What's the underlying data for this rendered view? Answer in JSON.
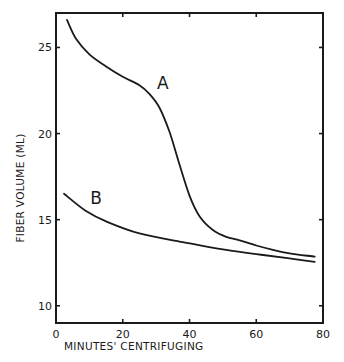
{
  "chart_data": {
    "type": "line",
    "title": "",
    "xlabel": "MINUTES' CENTRIFUGING",
    "ylabel": "FIBER VOLUME  (ML)",
    "xlim": [
      0,
      80
    ],
    "ylim": [
      9,
      27
    ],
    "xticks": [
      0,
      20,
      40,
      60,
      80
    ],
    "yticks": [
      10,
      15,
      20,
      25
    ],
    "xtick_labels": [
      "0",
      "20",
      "40",
      "60",
      "80"
    ],
    "ytick_labels": [
      "10",
      "15",
      "20",
      "25"
    ],
    "grid": false,
    "legend": "none",
    "series": [
      {
        "name": "A",
        "label_at": [
          32,
          22.6
        ],
        "x": [
          3.3,
          6,
          10,
          15,
          20,
          25,
          28,
          31,
          34,
          37,
          40,
          43,
          47,
          51,
          55,
          60,
          65,
          70,
          77.5
        ],
        "y": [
          26.6,
          25.5,
          24.6,
          23.9,
          23.3,
          22.8,
          22.3,
          21.5,
          20.1,
          18.2,
          16.4,
          15.2,
          14.4,
          14.0,
          13.8,
          13.5,
          13.25,
          13.05,
          12.85
        ]
      },
      {
        "name": "B",
        "label_at": [
          12,
          15.9
        ],
        "x": [
          2.4,
          9,
          15,
          25,
          38,
          49,
          60,
          70,
          77.5
        ],
        "y": [
          16.5,
          15.5,
          14.9,
          14.2,
          13.7,
          13.3,
          13.0,
          12.75,
          12.55
        ]
      }
    ]
  }
}
